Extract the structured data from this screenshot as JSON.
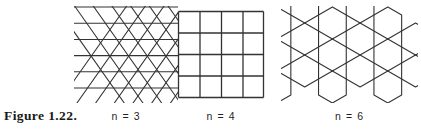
{
  "figure": {
    "label": "Figure 1.22.",
    "caption_font_color": "#1f1f1f",
    "line_color": "#333333",
    "background_color": "#ffffff"
  },
  "panels": [
    {
      "id": "triangular-tiling",
      "caption": "n = 3",
      "polygon_sides": 3,
      "shape_name": "triangle",
      "description": "triangular tiling",
      "clipped_edges": true
    },
    {
      "id": "square-tiling",
      "caption": "n = 4",
      "polygon_sides": 4,
      "shape_name": "square",
      "description": "square tiling, 4 by 4 grid of cells",
      "rows": 4,
      "columns": 4,
      "clipped_edges": false
    },
    {
      "id": "hexagonal-tiling",
      "caption": "n = 6",
      "polygon_sides": 6,
      "shape_name": "hexagon",
      "description": "hexagonal honeycomb tiling",
      "clipped_edges": true
    }
  ]
}
